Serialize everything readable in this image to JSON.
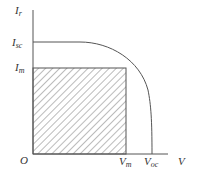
{
  "diagram": {
    "y_axis_label": {
      "main": "I",
      "sub": "r"
    },
    "x_axis_label": "V",
    "origin_label": "O",
    "y_ticks": [
      {
        "main": "I",
        "sub": "sc"
      },
      {
        "main": "I",
        "sub": "m"
      }
    ],
    "x_ticks": [
      {
        "main": "V",
        "sub": "m"
      },
      {
        "main": "V",
        "sub": "oc"
      }
    ],
    "colors": {
      "line": "#555555",
      "hatch": "#777777",
      "text": "#333333"
    }
  }
}
